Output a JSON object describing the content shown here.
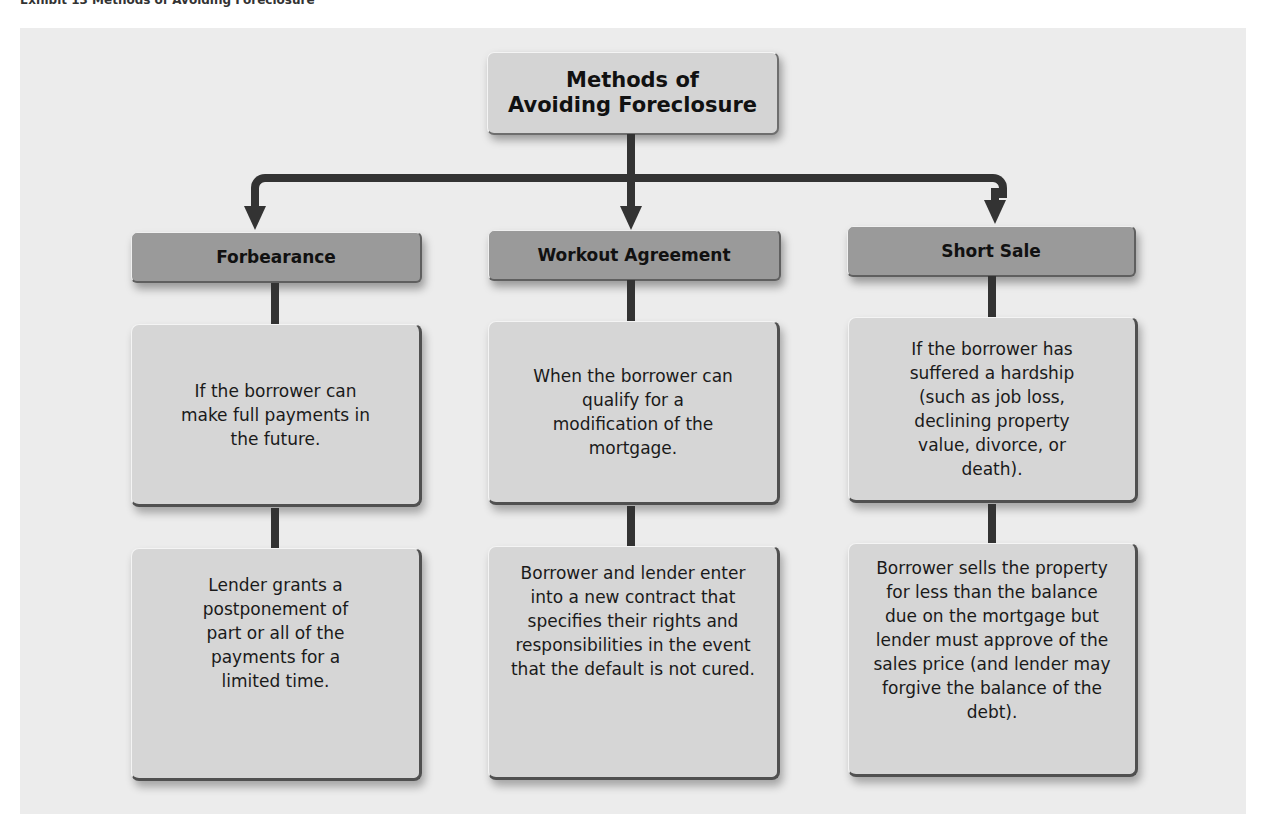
{
  "header_strip": {
    "text": "Exhibit 13 Methods of Avoiding Foreclosure"
  },
  "diagram": {
    "title_line1": "Methods of",
    "title_line2": "Avoiding Foreclosure",
    "colors": {
      "panel_bg": "#ececec",
      "title_box": "#d4d4d4",
      "header_box": "#9a9a9a",
      "detail_box": "#d6d6d6",
      "connector": "#333333"
    },
    "branches": [
      {
        "label": "Forbearance",
        "condition": "If the borrower can make full payments in the future.",
        "action": "Lender grants a postponement of part or all of the payments for a limited time."
      },
      {
        "label": "Workout Agreement",
        "condition": "When the borrower can qualify for a modification of the mortgage.",
        "action": "Borrower and lender enter into a new contract that specifies their rights and responsibilities in the event that the default is not cured."
      },
      {
        "label": "Short Sale",
        "condition": "If the borrower has suffered a hardship (such as job loss, declining property value, divorce, or death).",
        "action": "Borrower sells the property for less than the balance due on the mortgage but lender must approve of the sales price (and lender may forgive the balance of the debt)."
      }
    ]
  }
}
